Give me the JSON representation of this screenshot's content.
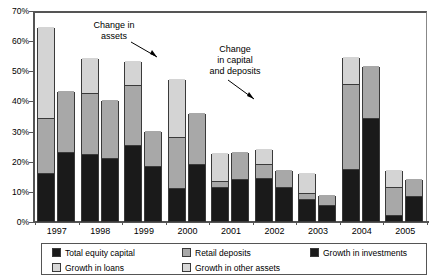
{
  "chart_data": {
    "type": "bar",
    "title": "",
    "subtitle": "",
    "xlabel": "",
    "ylabel": "",
    "ylim": [
      0,
      70
    ],
    "ytick_values": [
      0,
      10,
      20,
      30,
      40,
      50,
      60,
      70
    ],
    "ytick_labels": [
      "0%",
      "10%",
      "20%",
      "30%",
      "40%",
      "50%",
      "60%",
      "70%"
    ],
    "grid": false,
    "legend_position": "bottom",
    "stacked": true,
    "grouped_pairs": true,
    "categories": [
      "1997",
      "1998",
      "1999",
      "2000",
      "2001",
      "2002",
      "2003",
      "2004",
      "2005"
    ],
    "group_descriptions": {
      "left_bar": "Change in capital and deposits",
      "right_bar": "Change in assets"
    },
    "series": [
      {
        "name": "Total equity capital",
        "color": "#1a1a1a",
        "bar": "left",
        "values": [
          15.5,
          22.0,
          25.0,
          10.5,
          11.0,
          14.0,
          7.0,
          17.0,
          1.5
        ]
      },
      {
        "name": "Retail deposits",
        "color": "#a8a8a8",
        "bar": "left",
        "values": [
          18.5,
          20.0,
          19.8,
          17.0,
          2.0,
          4.5,
          2.0,
          28.0,
          9.5
        ]
      },
      {
        "name": "Growth in other assets",
        "color": "#d4d4d4",
        "bar": "left",
        "values": [
          30.5,
          12.0,
          8.2,
          19.5,
          9.5,
          5.5,
          7.0,
          9.5,
          6.0
        ]
      },
      {
        "name": "Growth in investments",
        "color": "#1a1a1a",
        "bar": "right",
        "values": [
          22.5,
          20.7,
          18.0,
          18.5,
          13.5,
          11.0,
          5.0,
          34.0,
          8.0
        ]
      },
      {
        "name": "Growth in loans",
        "color": "#a8a8a8",
        "bar": "right",
        "values": [
          20.7,
          19.6,
          12.0,
          17.3,
          9.5,
          6.0,
          3.5,
          17.5,
          6.0
        ]
      }
    ],
    "bar_totals": {
      "left": [
        64.5,
        54.0,
        53.0,
        47.0,
        22.5,
        24.0,
        16.0,
        54.5,
        17.0
      ],
      "right": [
        43.2,
        40.3,
        30.0,
        35.8,
        23.0,
        17.0,
        8.5,
        51.5,
        14.0
      ]
    },
    "annotations": [
      {
        "id": "assets",
        "text": "Change in\nassets",
        "points_to": "1999 left bar top"
      },
      {
        "id": "capital",
        "text": "Change\nin capital\nand deposits",
        "points_to": "2000 right bar top"
      }
    ],
    "legend": [
      {
        "label": "Total equity capital",
        "swatch": "black"
      },
      {
        "label": "Retail deposits",
        "swatch": "medium"
      },
      {
        "label": "Growth in investments",
        "swatch": "black"
      },
      {
        "label": "Growth in loans",
        "swatch": "light"
      },
      {
        "label": "Growth in other assets",
        "swatch": "light"
      }
    ]
  },
  "axis": {
    "yticks": [
      {
        "label": "70%",
        "value": 70
      },
      {
        "label": "60%",
        "value": 60
      },
      {
        "label": "50%",
        "value": 50
      },
      {
        "label": "40%",
        "value": 40
      },
      {
        "label": "30%",
        "value": 30
      },
      {
        "label": "20%",
        "value": 20
      },
      {
        "label": "10%",
        "value": 10
      },
      {
        "label": "0%",
        "value": 0
      }
    ],
    "xticks": [
      "1997",
      "1998",
      "1999",
      "2000",
      "2001",
      "2002",
      "2003",
      "2004",
      "2005"
    ]
  },
  "annotations": {
    "assets": "Change in\nassets",
    "capital": "Change\nin capital\nand deposits"
  },
  "legend": {
    "items": [
      {
        "label": "Total equity capital",
        "swatch": "black"
      },
      {
        "label": "Retail deposits",
        "swatch": "medium"
      },
      {
        "label": "Growth in investments",
        "swatch": "black"
      },
      {
        "label": "Growth in loans",
        "swatch": "light"
      },
      {
        "label": "Growth in other assets",
        "swatch": "light"
      }
    ]
  },
  "colors": {
    "black": "#1a1a1a",
    "medium": "#a8a8a8",
    "light": "#d4d4d4",
    "outline": "#3a3a3a",
    "axis": "#555555"
  }
}
